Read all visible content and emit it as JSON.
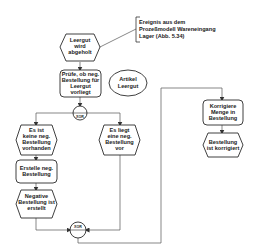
{
  "diagram": {
    "type": "EPK",
    "annotation": {
      "lines": [
        "Ereignis aus dem",
        "Prozeßmodell Wareneingang",
        "Lager (Abb. 5.34)"
      ]
    },
    "nodes": {
      "start_event": {
        "kind": "event",
        "lines": [
          "Leergut",
          "wird",
          "abgeholt"
        ]
      },
      "check_function": {
        "kind": "function",
        "lines": [
          "Prüfe, ob neg.",
          "Bestellung für",
          "Leergut",
          "vorliegt"
        ]
      },
      "object_artikel": {
        "kind": "information-object",
        "lines": [
          "Artikel",
          "Leergut"
        ]
      },
      "xor_split": {
        "kind": "operator",
        "label": "XOR"
      },
      "event_none": {
        "kind": "event",
        "lines": [
          "Es ist",
          "keine neg.",
          "Bestellung",
          "vorhanden"
        ]
      },
      "event_exists": {
        "kind": "event",
        "lines": [
          "Es liegt",
          "eine neg.",
          "Bestellung",
          "vor"
        ]
      },
      "create_function": {
        "kind": "function",
        "lines": [
          "Erstelle neg.",
          "Bestellung"
        ]
      },
      "event_created": {
        "kind": "event",
        "lines": [
          "Negative",
          "Bestellung ist",
          "erstellt"
        ]
      },
      "xor_join": {
        "kind": "operator",
        "label": "XOR"
      },
      "correct_function": {
        "kind": "function",
        "lines": [
          "Korrigiere",
          "Menge in",
          "Bestellung"
        ]
      },
      "event_corrected": {
        "kind": "event",
        "lines": [
          "Bestellung",
          "ist korrigiert"
        ]
      }
    }
  }
}
